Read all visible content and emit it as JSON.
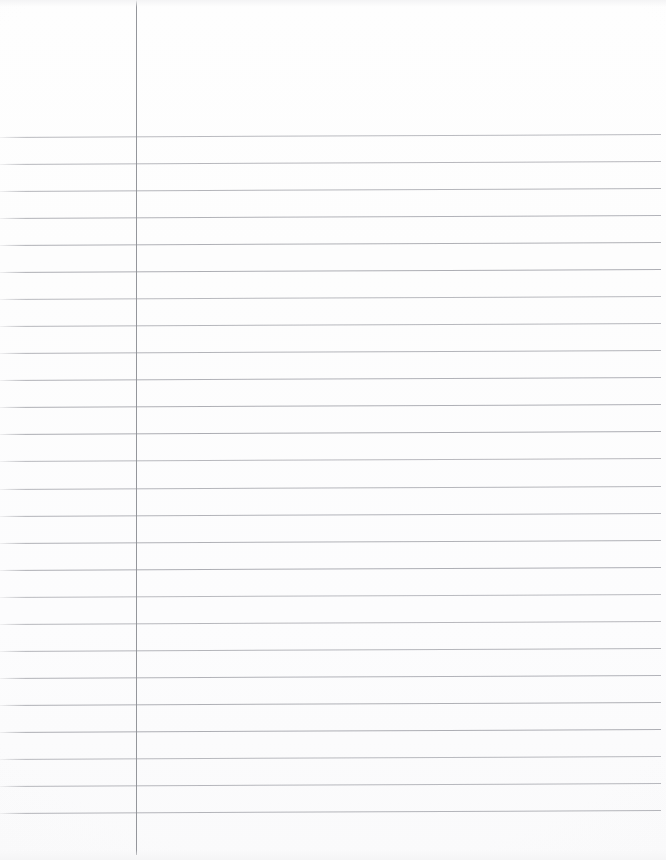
{
  "document": {
    "type": "ruled-notebook-paper",
    "title": "Blank Ruled Notebook Page",
    "description": "Scanned sheet of blank college-ruled loose-leaf notebook paper with a single vertical margin rule on the left and horizontal ruled writing lines.",
    "orientation": "portrait",
    "page_width": 666,
    "page_height": 860,
    "handwritten_text": "",
    "printed_text": "",
    "page_number": ""
  },
  "colors": {
    "paper_background": "#fdfdfd",
    "rule_line": "#a9aab0",
    "margin_line": "#8e9096",
    "edge_shadow": "#f4f4f5"
  },
  "margin_rule": {
    "label": "vertical-margin-line",
    "x": 136,
    "y_start": 0,
    "y_end": 855,
    "thickness": 1,
    "color": "#8e9096"
  },
  "ruling": {
    "label": "horizontal-ruled-lines",
    "count": 26,
    "first_line_y": 137,
    "line_spacing": 27.04,
    "x_start": 0,
    "x_end": 661,
    "thickness": 1,
    "color": "#a9aab0",
    "slant_degrees": -0.26,
    "line_y_positions": [
      137,
      164,
      191,
      218,
      245,
      272,
      299,
      326,
      353,
      380,
      407,
      434,
      461,
      489,
      516,
      543,
      570,
      597,
      624,
      651,
      678,
      705,
      732,
      759,
      786,
      813
    ]
  },
  "regions": {
    "header_area_label": "unruled-header-area",
    "left_margin_label": "left-margin-area",
    "writing_area_label": "writing-area",
    "footer_area_label": "unruled-footer-area"
  }
}
